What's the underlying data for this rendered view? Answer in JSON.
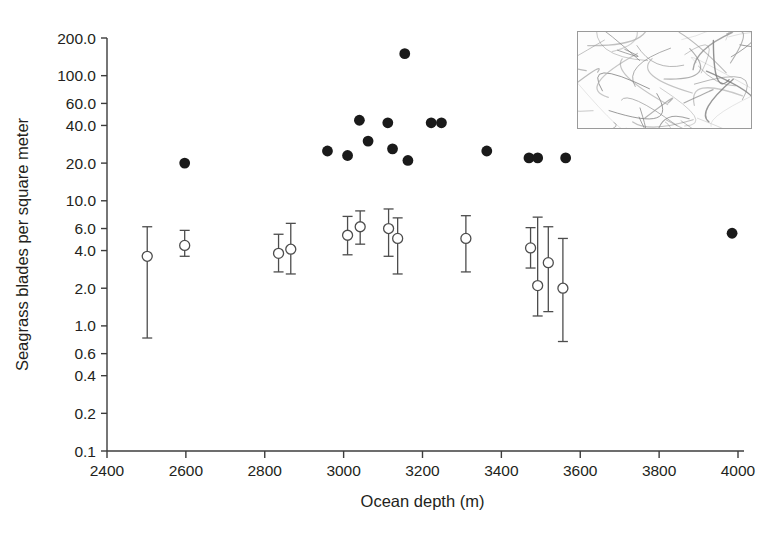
{
  "chart_data": {
    "type": "scatter",
    "title": "",
    "xlabel": "Ocean depth (m)",
    "ylabel": "Seagrass blades per square meter",
    "xlim": [
      2400,
      4000
    ],
    "ylim": [
      0.1,
      200.0
    ],
    "yscale": "log",
    "grid": false,
    "legend": "none",
    "xticks": [
      2400,
      2600,
      2800,
      3000,
      3200,
      3400,
      3600,
      3800,
      4000
    ],
    "xtick_labels": [
      "2400",
      "2600",
      "2800",
      "3000",
      "3200",
      "3400",
      "3600",
      "3800",
      "4000"
    ],
    "yticks": [
      200.0,
      100.0,
      60.0,
      40.0,
      20.0,
      10.0,
      6.0,
      4.0,
      2.0,
      1.0,
      0.6,
      0.4,
      0.2,
      0.1
    ],
    "ytick_labels": [
      "200.0",
      "100.0",
      "60.0",
      "40.0",
      "20.0",
      "10.0",
      "6.0",
      "4.0",
      "2.0",
      "1.0",
      "0.6",
      "0.4",
      "0.2",
      "0.1"
    ],
    "series": [
      {
        "name": "filled-points",
        "marker": "filled-circle",
        "color": "#1a1a1a",
        "points": [
          {
            "x": 2597,
            "y": 20.0
          },
          {
            "x": 2959,
            "y": 25.0
          },
          {
            "x": 3010,
            "y": 23.0
          },
          {
            "x": 3040,
            "y": 44.0
          },
          {
            "x": 3062,
            "y": 30.0
          },
          {
            "x": 3112,
            "y": 42.0
          },
          {
            "x": 3124,
            "y": 26.0
          },
          {
            "x": 3155,
            "y": 150.0
          },
          {
            "x": 3163,
            "y": 21.0
          },
          {
            "x": 3222,
            "y": 42.0
          },
          {
            "x": 3248,
            "y": 42.0
          },
          {
            "x": 3363,
            "y": 25.0
          },
          {
            "x": 3470,
            "y": 22.0
          },
          {
            "x": 3492,
            "y": 22.0
          },
          {
            "x": 3563,
            "y": 22.0
          },
          {
            "x": 3985,
            "y": 5.5
          }
        ]
      },
      {
        "name": "open-points-with-error-bars",
        "marker": "open-circle",
        "color": "#4d4d4d",
        "points": [
          {
            "x": 2502,
            "y": 3.6,
            "ylow": 0.8,
            "yhigh": 6.2
          },
          {
            "x": 2597,
            "y": 4.4,
            "ylow": 3.6,
            "yhigh": 5.8
          },
          {
            "x": 2835,
            "y": 3.8,
            "ylow": 2.7,
            "yhigh": 5.4
          },
          {
            "x": 2866,
            "y": 4.1,
            "ylow": 2.6,
            "yhigh": 6.6
          },
          {
            "x": 3010,
            "y": 5.3,
            "ylow": 3.7,
            "yhigh": 7.5
          },
          {
            "x": 3042,
            "y": 6.2,
            "ylow": 4.5,
            "yhigh": 8.3
          },
          {
            "x": 3114,
            "y": 6.0,
            "ylow": 3.6,
            "yhigh": 8.6
          },
          {
            "x": 3137,
            "y": 5.0,
            "ylow": 2.6,
            "yhigh": 7.3
          },
          {
            "x": 3310,
            "y": 5.0,
            "ylow": 2.7,
            "yhigh": 7.6
          },
          {
            "x": 3474,
            "y": 4.2,
            "ylow": 2.9,
            "yhigh": 6.1
          },
          {
            "x": 3492,
            "y": 2.1,
            "ylow": 1.2,
            "yhigh": 7.4
          },
          {
            "x": 3519,
            "y": 3.2,
            "ylow": 1.3,
            "yhigh": 6.2
          },
          {
            "x": 3556,
            "y": 2.0,
            "ylow": 0.75,
            "yhigh": 5.0
          }
        ]
      }
    ]
  },
  "inset": {
    "name": "seagrass-blades-photo",
    "caption": ""
  }
}
